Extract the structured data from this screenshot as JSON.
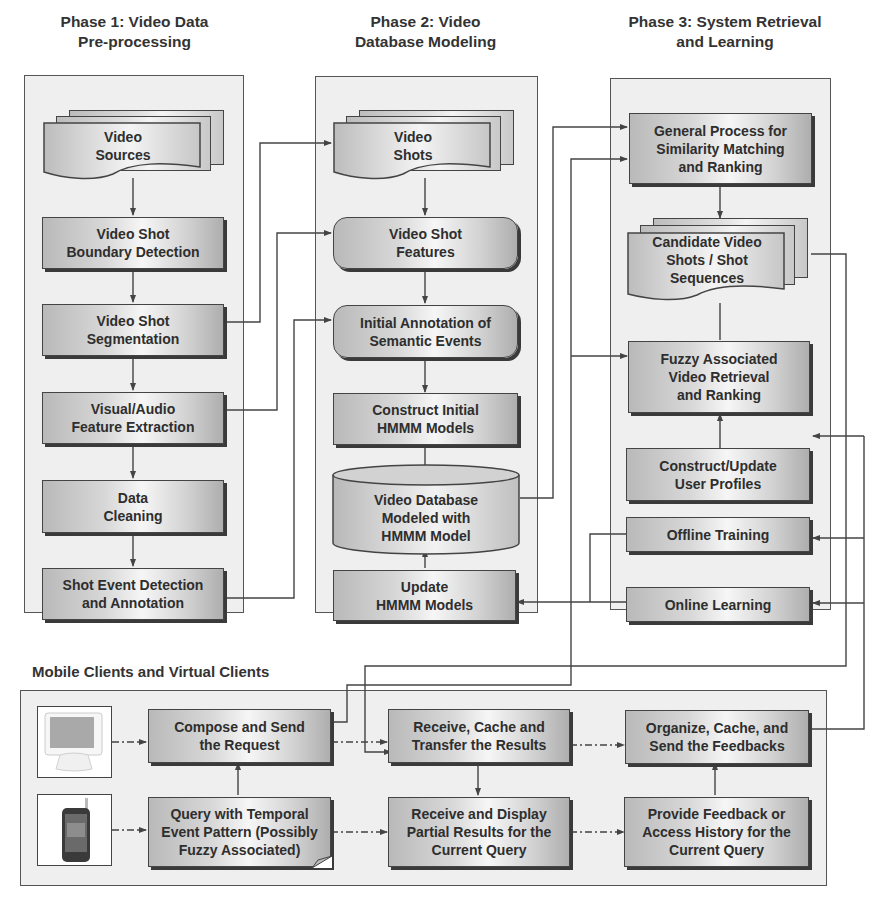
{
  "phases": [
    {
      "title_line1": "Phase 1: Video Data",
      "title_line2": "Pre-processing"
    },
    {
      "title_line1": "Phase 2: Video",
      "title_line2": "Database Modeling"
    },
    {
      "title_line1": "Phase 3: System Retrieval",
      "title_line2": "and Learning"
    }
  ],
  "phase1": {
    "nodes": [
      {
        "id": "video-sources",
        "line1": "Video",
        "line2": "Sources",
        "shape": "multi-document"
      },
      {
        "id": "boundary-detection",
        "line1": "Video Shot",
        "line2": "Boundary Detection",
        "shape": "rectangle"
      },
      {
        "id": "shot-segmentation",
        "line1": "Video Shot",
        "line2": "Segmentation",
        "shape": "rectangle"
      },
      {
        "id": "feature-extraction",
        "line1": "Visual/Audio",
        "line2": "Feature Extraction",
        "shape": "rectangle"
      },
      {
        "id": "data-cleaning",
        "line1": "Data",
        "line2": "Cleaning",
        "shape": "rectangle"
      },
      {
        "id": "event-detection",
        "line1": "Shot Event Detection",
        "line2": "and Annotation",
        "shape": "rectangle"
      }
    ]
  },
  "phase2": {
    "nodes": [
      {
        "id": "video-shots",
        "line1": "Video",
        "line2": "Shots",
        "shape": "multi-document"
      },
      {
        "id": "shot-features",
        "line1": "Video Shot",
        "line2": "Features",
        "shape": "rounded-rectangle"
      },
      {
        "id": "initial-annotation",
        "line1": "Initial Annotation of",
        "line2": "Semantic Events",
        "shape": "rounded-rectangle"
      },
      {
        "id": "construct-hmmm",
        "line1": "Construct Initial",
        "line2": "HMMM Models",
        "shape": "rectangle"
      },
      {
        "id": "video-database",
        "line1": "Video Database",
        "line2": "Modeled with",
        "line3": "HMMM Model",
        "shape": "cylinder"
      },
      {
        "id": "update-hmmm",
        "line1": "Update",
        "line2": "HMMM Models",
        "shape": "rectangle"
      }
    ]
  },
  "phase3": {
    "nodes": [
      {
        "id": "similarity-matching",
        "line1": "General Process for",
        "line2": "Similarity Matching",
        "line3": "and Ranking",
        "shape": "rectangle"
      },
      {
        "id": "candidate-shots",
        "line1": "Candidate Video",
        "line2": "Shots / Shot",
        "line3": "Sequences",
        "shape": "multi-document"
      },
      {
        "id": "fuzzy-retrieval",
        "line1": "Fuzzy Associated",
        "line2": "Video Retrieval",
        "line3": "and Ranking",
        "shape": "rectangle"
      },
      {
        "id": "user-profiles",
        "line1": "Construct/Update",
        "line2": "User Profiles",
        "shape": "rectangle"
      },
      {
        "id": "offline-training",
        "line1": "Offline Training",
        "shape": "rectangle"
      },
      {
        "id": "online-learning",
        "line1": "Online Learning",
        "shape": "rectangle"
      }
    ]
  },
  "clients": {
    "title": "Mobile Clients and Virtual Clients",
    "devices": [
      {
        "id": "desktop",
        "icon": "desktop-monitor-icon"
      },
      {
        "id": "mobile",
        "icon": "mobile-phone-icon"
      }
    ],
    "nodes": [
      {
        "id": "compose-request",
        "line1": "Compose and Send",
        "line2": "the Request",
        "shape": "rectangle"
      },
      {
        "id": "query-pattern",
        "line1": "Query with Temporal",
        "line2": "Event Pattern (Possibly",
        "line3": "Fuzzy Associated)",
        "shape": "note"
      },
      {
        "id": "receive-cache",
        "line1": "Receive, Cache and",
        "line2": "Transfer the Results",
        "shape": "rectangle"
      },
      {
        "id": "receive-display",
        "line1": "Receive and Display",
        "line2": "Partial Results for the",
        "line3": "Current Query",
        "shape": "rectangle"
      },
      {
        "id": "organize-feedback",
        "line1": "Organize, Cache, and",
        "line2": "Send the Feedbacks",
        "shape": "rectangle"
      },
      {
        "id": "provide-feedback",
        "line1": "Provide Feedback or",
        "line2": "Access History for the",
        "line3": "Current Query",
        "shape": "rectangle"
      }
    ]
  },
  "edges": [
    [
      "video-sources",
      "boundary-detection"
    ],
    [
      "boundary-detection",
      "shot-segmentation"
    ],
    [
      "shot-segmentation",
      "feature-extraction"
    ],
    [
      "feature-extraction",
      "data-cleaning"
    ],
    [
      "data-cleaning",
      "event-detection"
    ],
    [
      "shot-segmentation",
      "video-shots"
    ],
    [
      "feature-extraction",
      "shot-features"
    ],
    [
      "event-detection",
      "initial-annotation"
    ],
    [
      "video-shots",
      "shot-features"
    ],
    [
      "shot-features",
      "initial-annotation"
    ],
    [
      "initial-annotation",
      "construct-hmmm"
    ],
    [
      "construct-hmmm",
      "video-database"
    ],
    [
      "update-hmmm",
      "video-database"
    ],
    [
      "video-database",
      "similarity-matching"
    ],
    [
      "compose-request",
      "similarity-matching"
    ],
    [
      "compose-request",
      "fuzzy-retrieval"
    ],
    [
      "similarity-matching",
      "candidate-shots"
    ],
    [
      "candidate-shots",
      "fuzzy-retrieval"
    ],
    [
      "user-profiles",
      "fuzzy-retrieval"
    ],
    [
      "candidate-shots",
      "receive-cache"
    ],
    [
      "offline-training",
      "update-hmmm"
    ],
    [
      "online-learning",
      "update-hmmm"
    ],
    [
      "organize-feedback",
      "user-profiles"
    ],
    [
      "organize-feedback",
      "offline-training"
    ],
    [
      "organize-feedback",
      "online-learning"
    ],
    [
      "desktop",
      "compose-request"
    ],
    [
      "mobile",
      "query-pattern"
    ],
    [
      "query-pattern",
      "compose-request"
    ],
    [
      "compose-request",
      "receive-cache"
    ],
    [
      "query-pattern",
      "receive-display"
    ],
    [
      "receive-cache",
      "receive-display"
    ],
    [
      "receive-cache",
      "organize-feedback"
    ],
    [
      "receive-display",
      "provide-feedback"
    ],
    [
      "provide-feedback",
      "organize-feedback"
    ]
  ],
  "colors": {
    "panel_bg": "#efefef",
    "node_border": "#444444",
    "line": "#444444",
    "text": "#2e2e2e"
  }
}
